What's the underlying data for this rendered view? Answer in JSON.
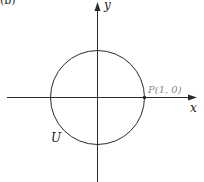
{
  "figure": {
    "panel_label": "(b)",
    "axes": {
      "x_label": "x",
      "y_label": "y",
      "origin": [
        97,
        97
      ]
    },
    "circle": {
      "label": "U",
      "center": [
        97,
        97
      ],
      "radius": 47
    },
    "point": {
      "label": "P(1, 0)",
      "coords": [
        1,
        0
      ]
    },
    "colors": {
      "stroke": "#2a2a2a",
      "point_label": "#888888",
      "background": "#ffffff"
    }
  }
}
